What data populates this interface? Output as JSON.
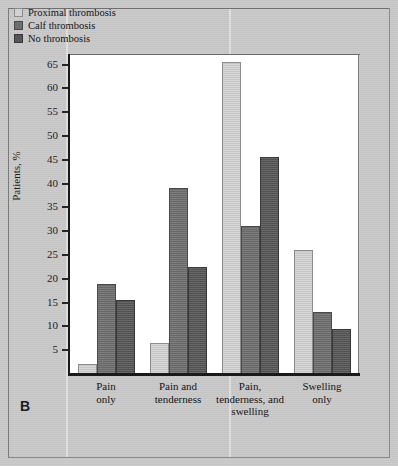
{
  "panel": {
    "letter": "B"
  },
  "chart_data": {
    "type": "bar",
    "title": "",
    "subtitle": "",
    "xlabel": "",
    "ylabel": "Patients, %",
    "ylim": [
      0,
      67
    ],
    "yticks": [
      5,
      10,
      15,
      20,
      25,
      30,
      35,
      40,
      45,
      50,
      55,
      60,
      65
    ],
    "grid": false,
    "legend_position": "top-left",
    "categories": [
      "Pain\nonly",
      "Pain and\ntenderness",
      "Pain,\ntenderness, and\nswelling",
      "Swelling\nonly"
    ],
    "category_lines": [
      [
        "Pain",
        "only"
      ],
      [
        "Pain and",
        "tenderness"
      ],
      [
        "Pain,",
        "tenderness, and",
        "swelling"
      ],
      [
        "Swelling",
        "only"
      ]
    ],
    "series": [
      {
        "name": "Proximal thrombosis",
        "color": "#d2d2d2",
        "values": [
          2,
          6.5,
          65.5,
          26
        ]
      },
      {
        "name": "Calf thrombosis",
        "color": "#6e6e6e",
        "values": [
          19,
          39,
          31,
          13
        ]
      },
      {
        "name": "No thrombosis",
        "color": "#565656",
        "values": [
          15.5,
          22.5,
          45.5,
          9.5
        ]
      }
    ]
  },
  "colors": {
    "page_background": "#c9c9c9",
    "plot_background": "#ffffff",
    "axis": "#1a1a1a",
    "text": "#151515"
  }
}
